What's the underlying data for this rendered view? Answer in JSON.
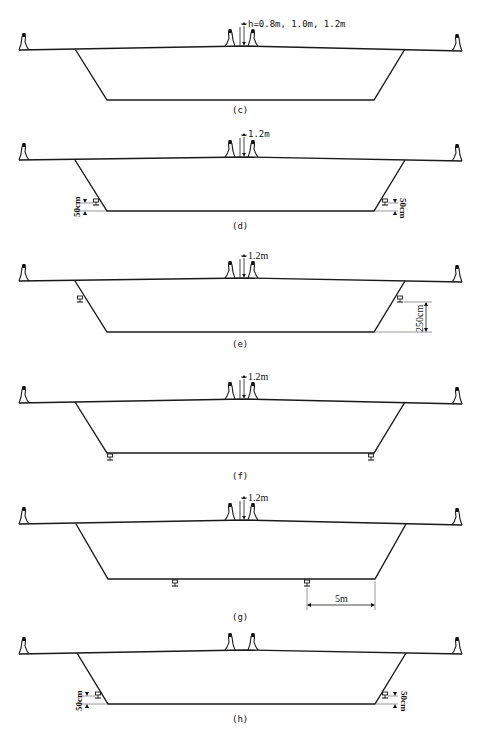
{
  "figure": {
    "panels": [
      {
        "id": "c",
        "label": "(c)",
        "height_note": "h=0.8m, 1.0m, 1.2m",
        "bearings": "none"
      },
      {
        "id": "d",
        "label": "(d)",
        "height_note": "1.2m",
        "bearings": "web-bottom",
        "dim_left": "50cm",
        "dim_right": "50cm"
      },
      {
        "id": "e",
        "label": "(e)",
        "height_note": "1.2m",
        "bearings": "web-upper",
        "dim_right": "250cm"
      },
      {
        "id": "f",
        "label": "(f)",
        "height_note": "1.2m",
        "bearings": "bottom-slab-corners"
      },
      {
        "id": "g",
        "label": "(g)",
        "height_note": "1.2m",
        "bearings": "bottom-slab-inner",
        "dim_bottom": "5m"
      },
      {
        "id": "h",
        "label": "(h)",
        "height_note": "",
        "bearings": "web-bottom",
        "dim_left": "50cm",
        "dim_right": "50cm"
      }
    ]
  }
}
